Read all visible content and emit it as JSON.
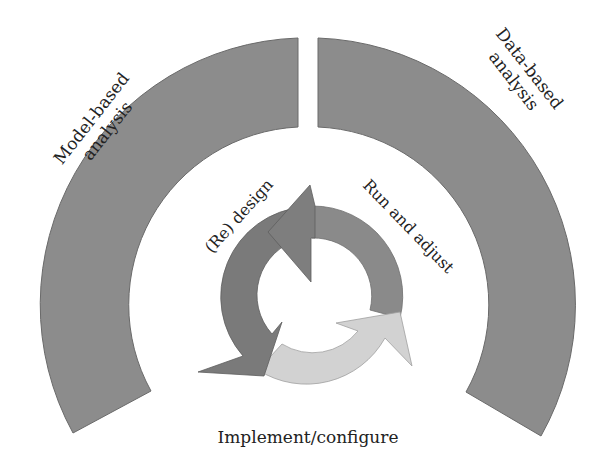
{
  "diagram": {
    "outer_arcs": [
      {
        "id": "model-based",
        "label_line1": "Model-based",
        "label_line2": "analysis"
      },
      {
        "id": "data-based",
        "label_line1": "Data-based",
        "label_line2": "analysis"
      }
    ],
    "cycle": [
      {
        "id": "redesign",
        "label": "(Re) design"
      },
      {
        "id": "run-adjust",
        "label": "Run and adjust"
      },
      {
        "id": "implement",
        "label": "Implement/configure"
      }
    ]
  },
  "colors": {
    "outer_arc": "#8c8c8c",
    "redesign_arrow": "#7a7a7a",
    "run_arrow": "#8a8a8a",
    "implement_arrow": "#d2d2d2",
    "stroke": "#6a6a6a",
    "text": "#222222"
  }
}
